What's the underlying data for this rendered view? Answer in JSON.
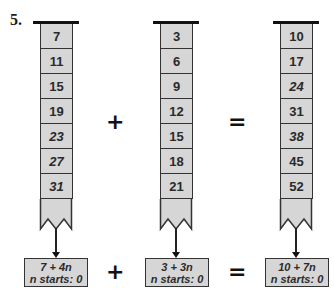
{
  "problem": {
    "number": "5."
  },
  "machines": [
    {
      "id": "left",
      "values": [
        "7",
        "11",
        "15",
        "19",
        "23",
        "27",
        "31"
      ],
      "italic": [
        false,
        false,
        false,
        false,
        true,
        true,
        true
      ],
      "rule": {
        "expression": "7 + 4n",
        "start": "n starts: 0"
      }
    },
    {
      "id": "middle",
      "values": [
        "3",
        "6",
        "9",
        "12",
        "15",
        "18",
        "21"
      ],
      "italic": [
        false,
        false,
        false,
        false,
        false,
        false,
        false
      ],
      "rule": {
        "expression": "3 + 3n",
        "start": "n starts: 0"
      }
    },
    {
      "id": "right",
      "values": [
        "10",
        "17",
        "24",
        "31",
        "38",
        "45",
        "52"
      ],
      "italic": [
        false,
        false,
        true,
        false,
        true,
        false,
        false
      ],
      "rule": {
        "expression": "10 + 7n",
        "start": "n starts: 0"
      }
    }
  ],
  "operators": {
    "column_plus": "+",
    "column_equals": "=",
    "rule_plus": "+",
    "rule_equals": "="
  }
}
